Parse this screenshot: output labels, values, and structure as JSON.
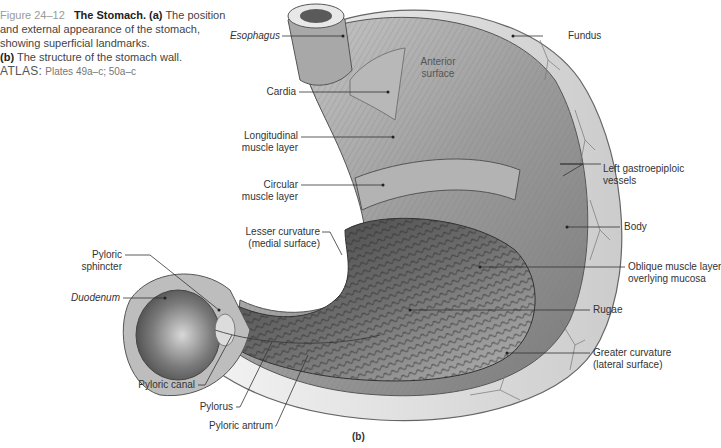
{
  "caption": {
    "figure_number": "Figure 24–12",
    "title": "The Stomach.",
    "part_a_marker": "(a)",
    "part_a_text": "The position and external appearance of the stomach, showing superficial landmarks.",
    "part_b_marker": "(b)",
    "part_b_text": "The structure of the stomach wall.",
    "atlas_label": "ATLAS:",
    "atlas_value": "Plates 49a–c; 50a–c"
  },
  "subfigure_label": "(b)",
  "labels": {
    "esophagus": "Esophagus",
    "anterior_surface_1": "Anterior",
    "anterior_surface_2": "surface",
    "fundus": "Fundus",
    "cardia": "Cardia",
    "longitudinal_1": "Longitudinal",
    "longitudinal_2": "muscle layer",
    "circular_1": "Circular",
    "circular_2": "muscle layer",
    "left_gastroepiploic_1": "Left gastroepiploic",
    "left_gastroepiploic_2": "vessels",
    "body": "Body",
    "lesser_curvature_1": "Lesser curvature",
    "lesser_curvature_2": "(medial surface)",
    "pyloric_sphincter_1": "Pyloric",
    "pyloric_sphincter_2": "sphincter",
    "oblique_1": "Oblique muscle layer",
    "oblique_2": "overlying mucosa",
    "duodenum": "Duodenum",
    "rugae": "Rugae",
    "greater_curvature_1": "Greater curvature",
    "greater_curvature_2": "(lateral surface)",
    "pyloric_canal": "Pyloric canal",
    "pylorus": "Pylorus",
    "pyloric_antrum": "Pyloric antrum"
  },
  "colors": {
    "caption_figure_number": "#9a9a9a",
    "leader_line": "#333333",
    "illustration_light": "#e6e6e6",
    "illustration_mid": "#9a9a9a",
    "illustration_dark": "#4a4a4a"
  }
}
